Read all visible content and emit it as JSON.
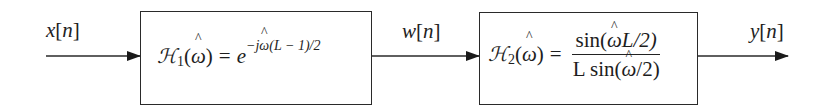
{
  "diagram": {
    "type": "block-diagram",
    "colors": {
      "line": "#2a2a2a",
      "text": "#1d1d1d",
      "background": "#ffffff"
    },
    "signals": {
      "input": {
        "name": "x",
        "index": "n",
        "label": "x[n]"
      },
      "intermediate": {
        "name": "w",
        "index": "n",
        "label": "w[n]"
      },
      "output": {
        "name": "y",
        "index": "n",
        "label": "y[n]"
      }
    },
    "blocks": [
      {
        "id": "H1",
        "symbol": "H",
        "subscript": "1",
        "argument": "ω̂",
        "expression": "𝓗1(ω̂) = e^{-jω̂(L − 1)/2}",
        "rhs": {
          "base": "e",
          "exponent_prefix": "−j",
          "exponent_var": "ω",
          "exponent_suffix": "(L − 1)/2"
        }
      },
      {
        "id": "H2",
        "symbol": "H",
        "subscript": "2",
        "argument": "ω̂",
        "expression": "𝓗2(ω̂) = sin(ω̂L/2) / (L sin(ω̂/2))",
        "rhs": {
          "numerator": {
            "pre": "sin(",
            "var": "ω",
            "post": "L/2)"
          },
          "denominator": {
            "pre": "L sin(",
            "var": "ω",
            "post": "/2)"
          }
        }
      }
    ],
    "connections": [
      {
        "from": "x[n]",
        "to": "H1"
      },
      {
        "from": "H1",
        "to": "w[n]"
      },
      {
        "from": "w[n]",
        "to": "H2"
      },
      {
        "from": "H2",
        "to": "y[n]"
      }
    ]
  }
}
